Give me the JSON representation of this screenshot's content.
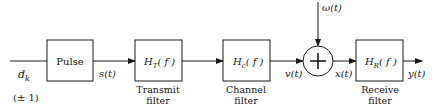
{
  "diagram": {
    "input": {
      "symbol": "d",
      "subscript": "k",
      "values": "(± 1)"
    },
    "blocks": [
      {
        "id": "pulse",
        "label": "Pulse",
        "caption1": "",
        "caption2": ""
      },
      {
        "id": "transmit",
        "label_main": "H",
        "label_sub": "T",
        "label_arg": "( f )",
        "caption1": "Transmit",
        "caption2": "filter"
      },
      {
        "id": "channel",
        "label_main": "H",
        "label_sub": "c",
        "label_arg": "( f )",
        "caption1": "Channel",
        "caption2": "filter"
      },
      {
        "id": "receive",
        "label_main": "H",
        "label_sub": "R",
        "label_arg": "( f )",
        "caption1": "Receive",
        "caption2": "filter"
      }
    ],
    "summer": {
      "symbol": "+",
      "noise_label": "ω(t)"
    },
    "signals": {
      "s": "s(t)",
      "v": "v(t)",
      "x": "x(t)",
      "y": "y(t)"
    }
  }
}
